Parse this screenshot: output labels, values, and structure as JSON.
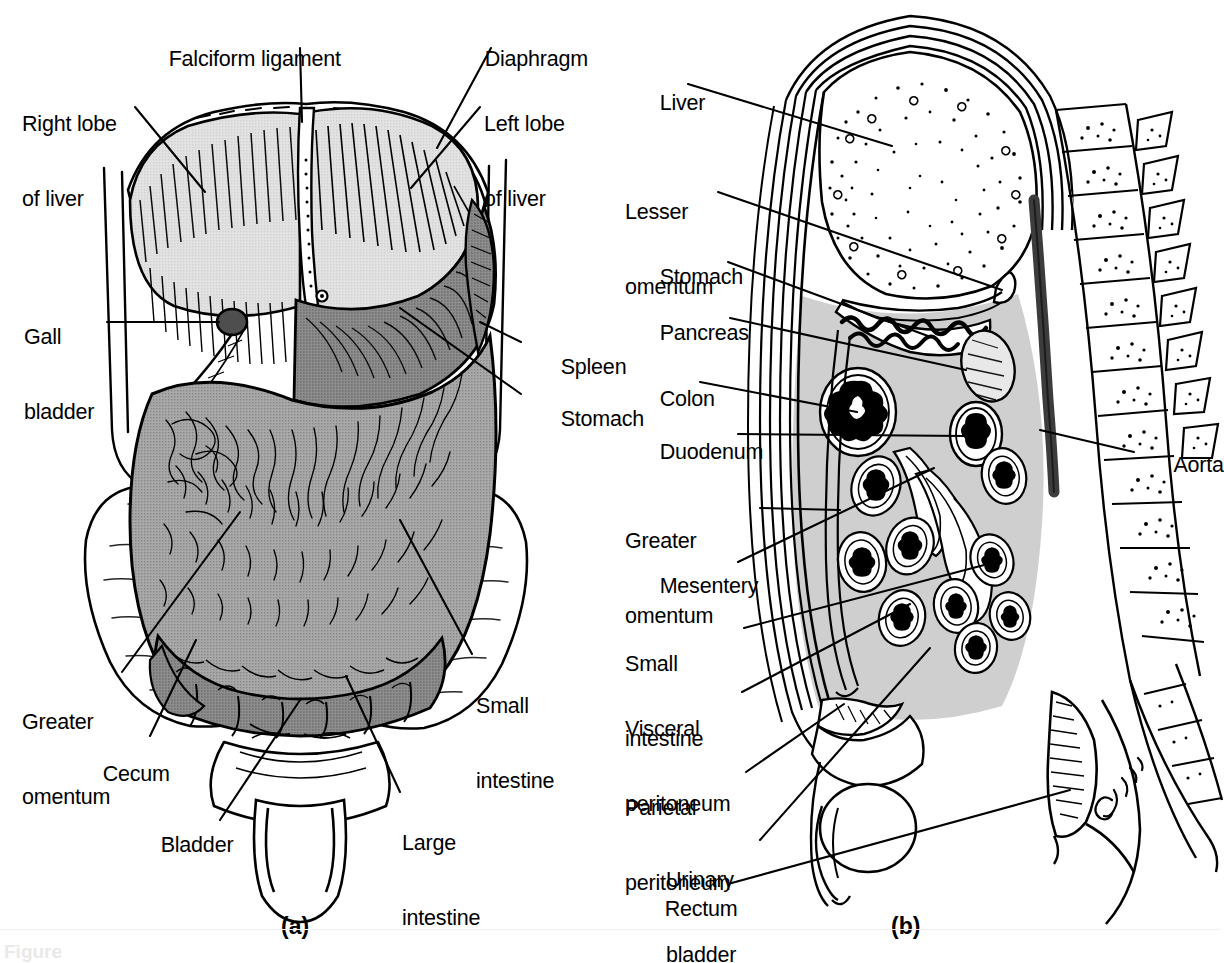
{
  "figure": {
    "type": "anatomy-diagram",
    "title_stub": "Figure",
    "panels": [
      {
        "id": "a",
        "letter": "(a)",
        "view": "anterior view of abdominal viscera"
      },
      {
        "id": "b",
        "letter": "(b)",
        "view": "midsagittal section of abdominopelvic cavity"
      }
    ],
    "artist_signature": "Garbo"
  },
  "panel_a": {
    "letter": "(a)",
    "labels": [
      {
        "key": "falciform_ligament",
        "text": "Falciform ligament",
        "lines": [
          "Falciform ligament"
        ]
      },
      {
        "key": "diaphragm",
        "text": "Diaphragm",
        "lines": [
          "Diaphragm"
        ]
      },
      {
        "key": "right_lobe_of_liver",
        "text": "Right lobe of liver",
        "lines": [
          "Right lobe",
          "of liver"
        ]
      },
      {
        "key": "left_lobe_of_liver",
        "text": "Left lobe of liver",
        "lines": [
          "Left lobe",
          "of liver"
        ]
      },
      {
        "key": "gall_bladder",
        "text": "Gall bladder",
        "lines": [
          "Gall",
          "bladder"
        ]
      },
      {
        "key": "spleen",
        "text": "Spleen",
        "lines": [
          "Spleen"
        ]
      },
      {
        "key": "stomach",
        "text": "Stomach",
        "lines": [
          "Stomach"
        ]
      },
      {
        "key": "greater_omentum",
        "text": "Greater omentum",
        "lines": [
          "Greater",
          "omentum"
        ]
      },
      {
        "key": "cecum",
        "text": "Cecum",
        "lines": [
          "Cecum"
        ]
      },
      {
        "key": "bladder",
        "text": "Bladder",
        "lines": [
          "Bladder"
        ]
      },
      {
        "key": "large_intestine",
        "text": "Large intestine",
        "lines": [
          "Large",
          "intestine"
        ]
      },
      {
        "key": "small_intestine",
        "text": "Small intestine",
        "lines": [
          "Small",
          "intestine"
        ]
      }
    ]
  },
  "panel_b": {
    "letter": "(b)",
    "labels": [
      {
        "key": "liver",
        "text": "Liver",
        "lines": [
          "Liver"
        ]
      },
      {
        "key": "lesser_omentum",
        "text": "Lesser omentum",
        "lines": [
          "Lesser",
          "omentum"
        ]
      },
      {
        "key": "stomach",
        "text": "Stomach",
        "lines": [
          "Stomach"
        ]
      },
      {
        "key": "pancreas",
        "text": "Pancreas",
        "lines": [
          "Pancreas"
        ]
      },
      {
        "key": "colon",
        "text": "Colon",
        "lines": [
          "Colon"
        ]
      },
      {
        "key": "duodenum",
        "text": "Duodenum",
        "lines": [
          "Duodenum"
        ]
      },
      {
        "key": "greater_omentum",
        "text": "Greater omentum",
        "lines": [
          "Greater",
          "omentum"
        ]
      },
      {
        "key": "mesentery",
        "text": "Mesentery",
        "lines": [
          "Mesentery"
        ]
      },
      {
        "key": "small_intestine",
        "text": "Small intestine",
        "lines": [
          "Small",
          "intestine"
        ]
      },
      {
        "key": "visceral_peritoneum",
        "text": "Visceral peritoneum",
        "lines": [
          "Visceral",
          "peritoneum"
        ]
      },
      {
        "key": "parietal_peritoneum",
        "text": "Parietal peritoneum",
        "lines": [
          "Parietal",
          "peritoneum"
        ]
      },
      {
        "key": "urinary_bladder",
        "text": "Urinary bladder",
        "lines": [
          "Urinary",
          "bladder"
        ]
      },
      {
        "key": "rectum",
        "text": "Rectum",
        "lines": [
          "Rectum"
        ]
      },
      {
        "key": "aorta",
        "text": "Aorta",
        "lines": [
          "Aorta"
        ]
      }
    ]
  },
  "colors": {
    "ink": "#000000",
    "background": "#ffffff",
    "liver_fill": "#d9d9d9",
    "stomach_fill": "#8f8f8f",
    "omentum_fill": "#a8a8a8",
    "peritoneal_cavity_fill": "#cccccc",
    "aorta_fill": "#555555"
  }
}
